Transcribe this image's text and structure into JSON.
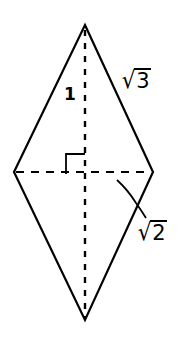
{
  "figure": {
    "type": "rhombus",
    "vertices": {
      "top": [
        85,
        25
      ],
      "right": [
        153,
        172
      ],
      "bottom": [
        85,
        320
      ],
      "left": [
        14,
        172
      ]
    },
    "diagonals": {
      "vertical": "dashed",
      "horizontal": "dashed"
    },
    "right_angle_marker": true,
    "stroke_color": "#000000",
    "background_color": "#ffffff"
  },
  "labels": {
    "half_diagonal": "1",
    "side": {
      "sign": "√",
      "radicand": "3"
    },
    "half_horizontal_diagonal": {
      "sign": "√",
      "radicand": "2"
    }
  }
}
